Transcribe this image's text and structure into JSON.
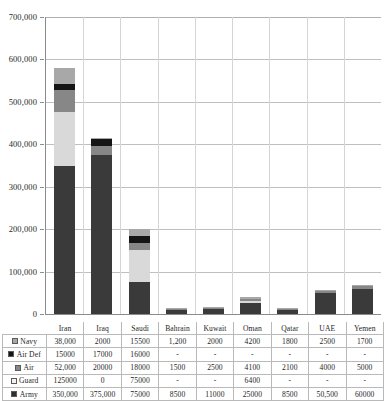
{
  "chart_data": {
    "type": "bar",
    "subtype": "stacked-column",
    "title": "",
    "xlabel": "",
    "ylabel": "",
    "ylim": [
      0,
      700000
    ],
    "ytick_step": 100000,
    "grid": true,
    "legend_position": "table-left",
    "categories": [
      "Iran",
      "Iraq",
      "Saudi",
      "Bahrain",
      "Kuwait",
      "Oman",
      "Qatar",
      "UAE",
      "Yemen"
    ],
    "ytick_labels": [
      "700,000",
      "600,000",
      "500,000",
      "400,000",
      "300,000",
      "200,000",
      "100,000",
      "0"
    ],
    "ytick_values": [
      700000,
      600000,
      500000,
      400000,
      300000,
      200000,
      100000,
      0
    ],
    "stack_order_bottom_to_top": [
      "Army",
      "Guard",
      "Air",
      "Air Def",
      "Navy"
    ],
    "series": [
      {
        "name": "Navy",
        "color": "#a8a8a8",
        "swatch": "sw-navy",
        "labels": [
          "38,000",
          "2000",
          "15500",
          "1,200",
          "2000",
          "4200",
          "1800",
          "2500",
          "1700"
        ],
        "values": [
          38000,
          2000,
          15500,
          1200,
          2000,
          4200,
          1800,
          2500,
          1700
        ]
      },
      {
        "name": "Air Def",
        "color": "#151515",
        "swatch": "sw-airdef",
        "labels": [
          "15000",
          "17000",
          "16000",
          "-",
          "-",
          "-",
          "-",
          "-",
          "-"
        ],
        "values": [
          15000,
          17000,
          16000,
          0,
          0,
          0,
          0,
          0,
          0
        ]
      },
      {
        "name": "Air",
        "color": "#878787",
        "swatch": "sw-air",
        "labels": [
          "52,000",
          "20000",
          "18000",
          "1500",
          "2500",
          "4100",
          "2100",
          "4000",
          "5000"
        ],
        "values": [
          52000,
          20000,
          18000,
          1500,
          2500,
          4100,
          2100,
          4000,
          5000
        ]
      },
      {
        "name": "Guard",
        "color": "#d9d9d9",
        "swatch": "sw-guard",
        "labels": [
          "125000",
          "0",
          "75000",
          "-",
          "-",
          "6400",
          "-",
          "-",
          "-"
        ],
        "values": [
          125000,
          0,
          75000,
          0,
          0,
          6400,
          0,
          0,
          0
        ]
      },
      {
        "name": "Army",
        "color": "#3a3a3a",
        "swatch": "sw-army",
        "labels": [
          "350,000",
          "375,000",
          "75000",
          "8500",
          "11000",
          "25000",
          "8500",
          "50,500",
          "60000"
        ],
        "values": [
          350000,
          375000,
          75000,
          8500,
          11000,
          25000,
          8500,
          50500,
          60000
        ]
      }
    ],
    "totals": [
      580000,
      414000,
      199500,
      11200,
      15500,
      39700,
      12400,
      57000,
      66700
    ]
  }
}
